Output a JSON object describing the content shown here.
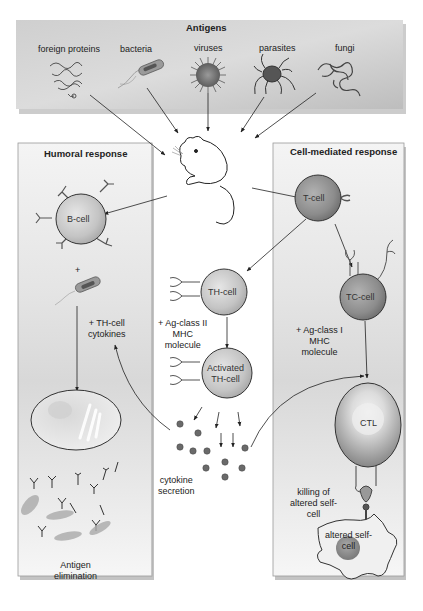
{
  "antigens": {
    "title": "Antigens",
    "items": [
      {
        "label": "foreign proteins"
      },
      {
        "label": "bacteria"
      },
      {
        "label": "viruses"
      },
      {
        "label": "parasites"
      },
      {
        "label": "fungi"
      }
    ]
  },
  "humoral": {
    "title": "Humoral response",
    "b_cell": "B-cell",
    "plus": "+",
    "th_cytokines_1": "+ TH-cell",
    "th_cytokines_2": "cytokines",
    "elimination_1": "Antigen",
    "elimination_2": "elimination"
  },
  "center": {
    "th_cell": "TH-cell",
    "mhc2_1": "+ Ag-class II",
    "mhc2_2": "MHC",
    "mhc2_3": "molecule",
    "activated_1": "Activated",
    "activated_2": "TH-cell",
    "cytokine_1": "cytokine",
    "cytokine_2": "secretion"
  },
  "cell_mediated": {
    "title": "Cell-mediated response",
    "t_cell": "T-cell",
    "tc_cell": "TC-cell",
    "mhc1_1": "+ Ag-class I",
    "mhc1_2": "MHC",
    "mhc1_3": "molecule",
    "ctl": "CTL",
    "killing_1": "killing of",
    "killing_2": "altered self-",
    "killing_3": "cell",
    "altered_1": "altered self-",
    "altered_2": "cell"
  }
}
